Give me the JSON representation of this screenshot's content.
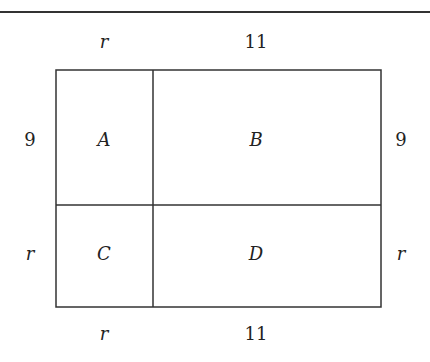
{
  "diagram": {
    "type": "area-model rectangle",
    "regions": [
      {
        "id": "A",
        "label": "A"
      },
      {
        "id": "B",
        "label": "B"
      },
      {
        "id": "C",
        "label": "C"
      },
      {
        "id": "D",
        "label": "D"
      }
    ],
    "top_labels": {
      "left": "r",
      "right": "11"
    },
    "bottom_labels": {
      "left": "r",
      "right": "11"
    },
    "left_labels": {
      "upper": "9",
      "lower": "r"
    },
    "right_labels": {
      "upper": "9",
      "lower": "r"
    },
    "colors": {
      "line": "#333333",
      "background": "#ffffff"
    }
  }
}
